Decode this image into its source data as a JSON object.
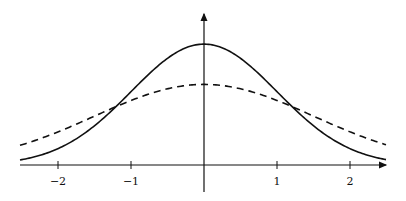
{
  "chart_data": {
    "type": "line",
    "title": "",
    "xlabel": "",
    "ylabel": "",
    "xlim": [
      -2.5,
      2.5
    ],
    "x_ticks": [
      -2,
      -1,
      1,
      2
    ],
    "x_tick_labels": [
      "−2",
      "−1",
      "1",
      "2"
    ],
    "grid": false,
    "legend": null,
    "series": [
      {
        "name": "normal density σ=1",
        "style": "solid",
        "function": "exp(-x^2/2)/sqrt(2π)",
        "sigma": 1.0,
        "peak": 0.399
      },
      {
        "name": "normal density σ=1.5",
        "style": "dashed",
        "function": "exp(-x^2/(2·1.5^2))/(1.5·sqrt(2π))",
        "sigma": 1.5,
        "peak": 0.266
      }
    ],
    "annotations": [
      "curves intersect near x = ±1.15"
    ]
  },
  "axis": {
    "origin_px": [
      204,
      165
    ],
    "unit_x_px": 73,
    "unit_y_px": 303,
    "x_start_px": 20,
    "x_end_px": 386
  },
  "colors": {
    "ink": "#111111",
    "background": "#ffffff"
  }
}
